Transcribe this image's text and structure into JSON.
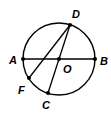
{
  "diagram": {
    "type": "circle-geometry",
    "circle": {
      "center": "O",
      "cx": 59,
      "cy": 59,
      "r": 36
    },
    "points": [
      {
        "name": "A",
        "x": 23,
        "y": 59,
        "label_x": 9,
        "label_y": 64
      },
      {
        "name": "B",
        "x": 95,
        "y": 59,
        "label_x": 100,
        "label_y": 65
      },
      {
        "name": "D",
        "x": 70,
        "y": 25,
        "label_x": 72,
        "label_y": 18
      },
      {
        "name": "O",
        "x": 59,
        "y": 59,
        "label_x": 63,
        "label_y": 73
      },
      {
        "name": "F",
        "x": 29,
        "y": 78,
        "label_x": 18,
        "label_y": 94
      },
      {
        "name": "C",
        "x": 48,
        "y": 93,
        "label_x": 42,
        "label_y": 109
      }
    ],
    "segments": [
      {
        "from": "A",
        "to": "B",
        "role": "diameter"
      },
      {
        "from": "D",
        "to": "C",
        "role": "diameter"
      },
      {
        "from": "D",
        "to": "F",
        "role": "chord"
      }
    ],
    "labels": {
      "A": "A",
      "B": "B",
      "C": "C",
      "D": "D",
      "F": "F",
      "O": "O"
    },
    "stroke_color": "#000000"
  }
}
